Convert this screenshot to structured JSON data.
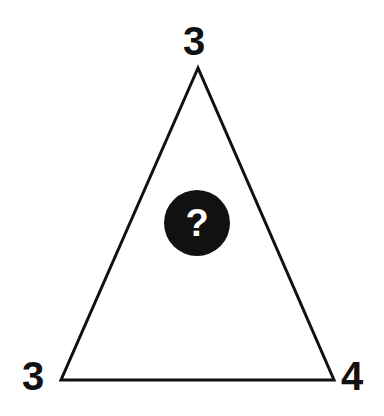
{
  "puzzle": {
    "shape": "triangle",
    "vertices": {
      "top": "3",
      "bottom_left": "3",
      "bottom_right": "4"
    },
    "center": "?",
    "colors": {
      "line": "#111111",
      "text": "#111111",
      "badge_bg": "#111111",
      "badge_text": "#ffffff",
      "background": "#ffffff"
    }
  }
}
